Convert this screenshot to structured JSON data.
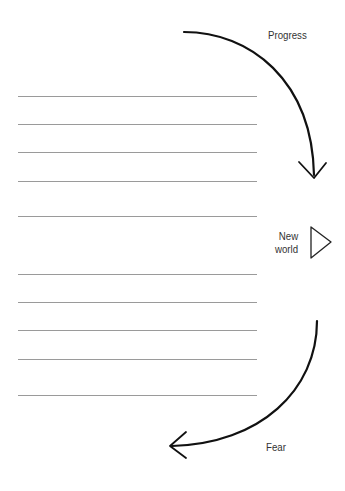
{
  "labels": {
    "top": "Progress",
    "middle_line1": "New",
    "middle_line2": "world",
    "bottom": "Fear"
  },
  "lines": {
    "count": 10,
    "y_positions": [
      96,
      124,
      152,
      181,
      216,
      274,
      302,
      330,
      359,
      395
    ]
  },
  "colors": {
    "background": "#ffffff",
    "rule_line": "#9a9a9a",
    "arrow": "#111111",
    "text": "#333333"
  }
}
